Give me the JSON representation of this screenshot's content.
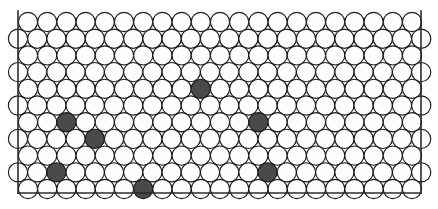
{
  "figure": {
    "title": "Random substitutional solid solution in a close-packed plane",
    "type": "packed-circle-lattice",
    "width": 438,
    "height": 209,
    "colors": {
      "background": "#ffffff",
      "host_atom_fill": "#fdfdfd",
      "solute_atom_fill": "#4a4a4a",
      "outline": "#1a1a1a",
      "frame": "#2b2b2b"
    },
    "frame": {
      "left_x": 18,
      "right_x": 421,
      "bottom_y": 193,
      "top_y": 11,
      "has_top_border": false,
      "has_left_border": true,
      "has_right_border": true,
      "has_bottom_border": true
    },
    "lattice": {
      "packing": "hexagonal-close-packed-2d",
      "circle_radius": 9.6,
      "circle_diameter": 19.2,
      "column_pitch": 19.2,
      "row_pitch": 16.7,
      "row_count": 11,
      "offset_rows_shift": 9.6,
      "first_row_center_y": 22,
      "even_row_first_center_x": 28,
      "odd_row_first_center_x": 18,
      "columns_per_even_row": 21,
      "columns_per_odd_row": 22,
      "total_circles": 236
    },
    "solute_atoms": {
      "count": 11,
      "label": "solute atoms",
      "positions": [
        {
          "row": 1,
          "col": 4
        },
        {
          "row": 2,
          "col": 19
        },
        {
          "row": 3,
          "col": 9
        },
        {
          "row": 5,
          "col": 2
        },
        {
          "row": 6,
          "col": 4
        },
        {
          "row": 5,
          "col": 12
        },
        {
          "row": 6,
          "col": 18
        },
        {
          "row": 8,
          "col": 1
        },
        {
          "row": 8,
          "col": 13
        },
        {
          "row": 9,
          "col": 6
        },
        {
          "row": 7,
          "col": 20
        }
      ],
      "pixel_centers": [
        {
          "cx": 106,
          "cy": 46
        },
        {
          "cx": 372,
          "cy": 67
        },
        {
          "cx": 205,
          "cy": 84
        },
        {
          "cx": 67,
          "cy": 115
        },
        {
          "cx": 96,
          "cy": 131
        },
        {
          "cx": 261,
          "cy": 116
        },
        {
          "cx": 353,
          "cy": 133
        },
        {
          "cx": 55,
          "cy": 165
        },
        {
          "cx": 270,
          "cy": 165
        },
        {
          "cx": 143,
          "cy": 182
        },
        {
          "cx": 372,
          "cy": 67
        }
      ]
    },
    "host_atoms": {
      "label": "host atoms"
    }
  }
}
